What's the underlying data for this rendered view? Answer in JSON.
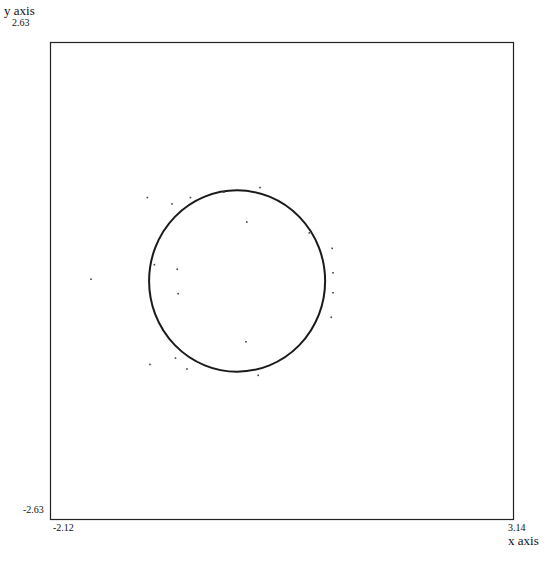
{
  "chart_data": {
    "type": "scatter",
    "title": "",
    "xlabel": "x axis",
    "ylabel": "y axis",
    "xlim": [
      -2.12,
      3.14
    ],
    "ylim": [
      -2.63,
      2.63
    ],
    "grid": false,
    "legend": null,
    "tick_labels": {
      "x_min": "-2.12",
      "x_max": "3.14",
      "y_min": "-2.63",
      "y_max": "2.63"
    },
    "series": [
      {
        "name": "circle",
        "kind": "line",
        "shape": "circle",
        "center": [
          0.0,
          0.0
        ],
        "radius": 1.0
      },
      {
        "name": "noise points",
        "kind": "scatter",
        "points": [
          [
            -1.66,
            0.02
          ],
          [
            -1.02,
            0.92
          ],
          [
            -0.74,
            0.85
          ],
          [
            -0.53,
            0.92
          ],
          [
            -0.68,
            0.13
          ],
          [
            -0.67,
            -0.14
          ],
          [
            0.11,
            0.65
          ],
          [
            0.1,
            -0.67
          ],
          [
            -0.99,
            -0.92
          ],
          [
            -0.7,
            -0.85
          ],
          [
            -0.57,
            -0.97
          ],
          [
            1.08,
            0.36
          ],
          [
            1.09,
            0.09
          ],
          [
            1.09,
            -0.13
          ],
          [
            1.07,
            -0.4
          ],
          [
            0.26,
            1.03
          ],
          [
            -0.15,
            0.98
          ],
          [
            0.24,
            -1.04
          ],
          [
            0.82,
            0.53
          ],
          [
            -0.94,
            0.18
          ]
        ]
      }
    ]
  }
}
